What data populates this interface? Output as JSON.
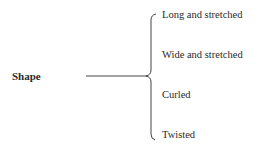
{
  "diagram": {
    "root": "Shape",
    "branches": [
      {
        "label": "Long and stretched"
      },
      {
        "label": "Wide and stretched"
      },
      {
        "label": "Curled"
      },
      {
        "label": "Twisted"
      }
    ],
    "line_color": "#444444"
  }
}
